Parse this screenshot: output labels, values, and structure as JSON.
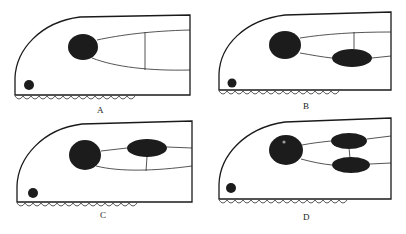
{
  "figure": {
    "panels": [
      {
        "id": "A",
        "label": "A",
        "description": "single large dark organ with two diverging lines joined by a vertical crossbar"
      },
      {
        "id": "B",
        "label": "B",
        "description": "large organ with a second oval on the lower branch; vertical link to upper line"
      },
      {
        "id": "C",
        "label": "C",
        "description": "large organ with a second oval on the upper branch; vertical link to lower line"
      },
      {
        "id": "D",
        "label": "D",
        "description": "large organ with two ovals, one on each branch, joined by a vertical link"
      }
    ],
    "colors": {
      "ink": "#1c1c1c",
      "background": "#ffffff"
    }
  }
}
